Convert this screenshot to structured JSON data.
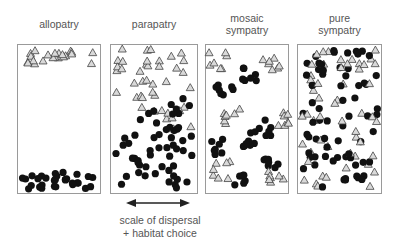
{
  "figure": {
    "panels": [
      {
        "id": "allopatry",
        "title_lines": [
          "allopatry"
        ],
        "box": [
          17,
          44,
          84,
          150
        ]
      },
      {
        "id": "parapatry",
        "title_lines": [
          "parapatry"
        ],
        "box": [
          110,
          44,
          88,
          150
        ]
      },
      {
        "id": "mosaic",
        "title_lines": [
          "mosaic",
          "sympatry"
        ],
        "box": [
          205,
          44,
          84,
          150
        ]
      },
      {
        "id": "pure",
        "title_lines": [
          "pure",
          "sympatry"
        ],
        "box": [
          297,
          44,
          85,
          150
        ]
      }
    ],
    "arrow": {
      "x1": 128,
      "x2": 188,
      "y": 203
    },
    "caption_lines": [
      "scale of dispersal",
      "+ habitat choice"
    ],
    "legend_symbols": {
      "circle": "species A (black circle)",
      "triangle": "species B (grey triangle)"
    },
    "colors": {
      "circle": "#111111",
      "triangle_fill": "#d9d9d9",
      "triangle_stroke": "#444444",
      "border": "#9a9a9a",
      "text": "#555555"
    }
  }
}
